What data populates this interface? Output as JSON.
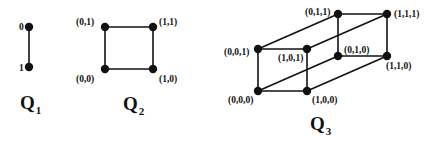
{
  "diagrams": [
    {
      "id": "q1",
      "title": "Q",
      "subscript": "1",
      "nodes": [
        {
          "label": "0",
          "x": 29,
          "y": 27,
          "lx": 19,
          "ly": 30
        },
        {
          "label": "1",
          "x": 29,
          "y": 67,
          "lx": 19,
          "ly": 71
        }
      ],
      "edges": [
        [
          0,
          1
        ]
      ]
    },
    {
      "id": "q2",
      "title": "Q",
      "subscript": "2",
      "nodes": [
        {
          "label": "(0,1)",
          "x": 105,
          "y": 27,
          "lx": 76,
          "ly": 25
        },
        {
          "label": "(1,1)",
          "x": 153,
          "y": 27,
          "lx": 159,
          "ly": 25
        },
        {
          "label": "(0,0)",
          "x": 105,
          "y": 69,
          "lx": 76,
          "ly": 82
        },
        {
          "label": "(1,0)",
          "x": 153,
          "y": 69,
          "lx": 159,
          "ly": 82
        }
      ],
      "edges": [
        [
          0,
          1
        ],
        [
          1,
          3
        ],
        [
          3,
          2
        ],
        [
          2,
          0
        ]
      ]
    },
    {
      "id": "q3",
      "title": "Q",
      "subscript": "3",
      "nodes": [
        {
          "label": "(0,0,0)",
          "x": 258,
          "y": 91,
          "lx": 228,
          "ly": 103
        },
        {
          "label": "(1,0,0)",
          "x": 307,
          "y": 91,
          "lx": 312,
          "ly": 103
        },
        {
          "label": "(0,0,1)",
          "x": 258,
          "y": 49,
          "lx": 224,
          "ly": 55
        },
        {
          "label": "(1,0,1)",
          "x": 307,
          "y": 49,
          "lx": 278,
          "ly": 61
        },
        {
          "label": "(0,1,0)",
          "x": 338,
          "y": 56,
          "lx": 344,
          "ly": 53
        },
        {
          "label": "(1,1,0)",
          "x": 387,
          "y": 56,
          "lx": 386,
          "ly": 69
        },
        {
          "label": "(0,1,1)",
          "x": 338,
          "y": 14,
          "lx": 305,
          "ly": 15
        },
        {
          "label": "(1,1,1)",
          "x": 387,
          "y": 14,
          "lx": 394,
          "ly": 17
        }
      ],
      "edges": [
        [
          0,
          1
        ],
        [
          0,
          2
        ],
        [
          1,
          3
        ],
        [
          2,
          3
        ],
        [
          0,
          4
        ],
        [
          1,
          5
        ],
        [
          2,
          6
        ],
        [
          3,
          7
        ],
        [
          4,
          5
        ],
        [
          4,
          6
        ],
        [
          5,
          7
        ],
        [
          6,
          7
        ]
      ]
    }
  ],
  "titles": [
    {
      "text": "Q",
      "sub": "1",
      "x": 20,
      "y": 109
    },
    {
      "text": "Q",
      "sub": "2",
      "x": 123,
      "y": 110
    },
    {
      "text": "Q",
      "sub": "3",
      "x": 310,
      "y": 130
    }
  ]
}
